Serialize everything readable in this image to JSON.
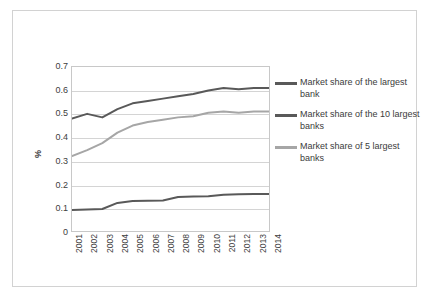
{
  "chart_data": {
    "type": "line",
    "title": "",
    "xlabel": "",
    "ylabel": "%",
    "categories": [
      "2001",
      "2002",
      "2003",
      "2004",
      "2005",
      "2006",
      "2007",
      "2008",
      "2009",
      "2010",
      "2011",
      "2012",
      "2013",
      "2014"
    ],
    "ylim": [
      0,
      0.7
    ],
    "ytick_values": [
      "0",
      "0.1",
      "0.2",
      "0.3",
      "0.4",
      "0.5",
      "0.6",
      "0.7"
    ],
    "grid": true,
    "legend_position": "right",
    "series": [
      {
        "name": "Market share of the 10 largest banks",
        "color": "#595959",
        "values": [
          0.48,
          0.5,
          0.485,
          0.52,
          0.545,
          0.555,
          0.565,
          0.575,
          0.585,
          0.6,
          0.61,
          0.605,
          0.61,
          0.61
        ]
      },
      {
        "name": "Market share of 5 largest banks",
        "color": "#a6a6a6",
        "values": [
          0.32,
          0.345,
          0.375,
          0.42,
          0.45,
          0.465,
          0.475,
          0.485,
          0.49,
          0.505,
          0.51,
          0.505,
          0.51,
          0.51
        ]
      },
      {
        "name": "Market share of the largest bank",
        "color": "#595959",
        "values": [
          0.09,
          0.092,
          0.094,
          0.12,
          0.128,
          0.129,
          0.13,
          0.145,
          0.147,
          0.148,
          0.155,
          0.157,
          0.158,
          0.158
        ]
      }
    ]
  },
  "legend": {
    "entries": [
      {
        "label": "Market share of the largest bank",
        "color": "#595959"
      },
      {
        "label": "Market share of the 10 largest banks",
        "color": "#595959"
      },
      {
        "label": "Market share of 5 largest banks",
        "color": "#a6a6a6"
      }
    ]
  }
}
